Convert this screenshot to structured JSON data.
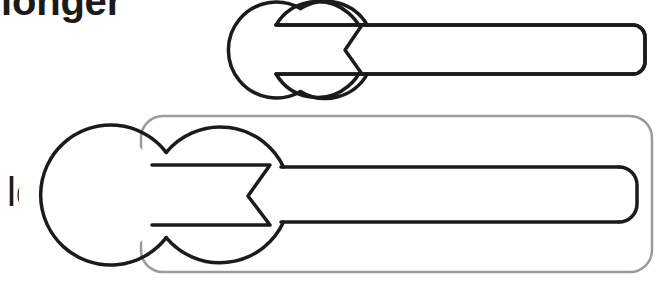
{
  "figure": {
    "background_color": "#ffffff",
    "width": 661,
    "height": 284
  },
  "labels": {
    "top": "longer",
    "bottom": "longer"
  },
  "colors": {
    "outline": "#1b1b1b",
    "highlight_box": "#9a9a9a",
    "text": "#1b1b1b",
    "fill": "#ffffff"
  },
  "items": [
    {
      "name": "small-wrench",
      "label": "longer",
      "label_weight": "bold",
      "clipped_top": true,
      "head_center_x": 333,
      "head_center_y": 50,
      "head_radius": 48,
      "handle_end_x": 645,
      "handle_top_y": 25,
      "handle_bottom_y": 74,
      "handle_corner_radius": 12,
      "jaw_tip_x": 276,
      "jaw_apex_x": 345,
      "stroke_width": 3.5,
      "boxed": false
    },
    {
      "name": "large-wrench",
      "label": "longer",
      "label_weight": "normal",
      "clipped_top": false,
      "head_center_x": 222,
      "head_center_y": 195,
      "head_radius": 70,
      "handle_end_x": 637,
      "handle_top_y": 167,
      "handle_bottom_y": 222,
      "handle_corner_radius": 18,
      "jaw_tip_x": 152,
      "jaw_apex_x": 248,
      "stroke_width": 3.5,
      "boxed": true,
      "box": {
        "x": 141,
        "y": 116,
        "width": 511,
        "height": 156,
        "corner_radius": 22,
        "stroke_width": 2.5
      }
    }
  ]
}
